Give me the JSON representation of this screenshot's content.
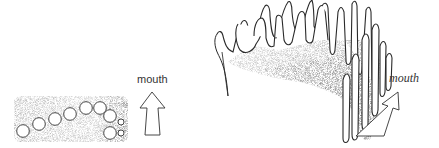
{
  "figure": {
    "left_panel": {
      "label": "mouth",
      "description": "top view of tooth row with circular tooth bases",
      "tooth_bases_large": [
        {
          "cx": 23,
          "cy": 131,
          "r": 6
        },
        {
          "cx": 39,
          "cy": 124,
          "r": 6
        },
        {
          "cx": 55,
          "cy": 119,
          "r": 6
        },
        {
          "cx": 70,
          "cy": 114,
          "r": 6
        },
        {
          "cx": 86,
          "cy": 108,
          "r": 6
        },
        {
          "cx": 100,
          "cy": 108,
          "r": 6
        },
        {
          "cx": 110,
          "cy": 116,
          "r": 6
        },
        {
          "cx": 110,
          "cy": 133,
          "r": 6
        }
      ],
      "tooth_bases_small": [
        {
          "cx": 121,
          "cy": 122,
          "r": 3
        },
        {
          "cx": 121,
          "cy": 133,
          "r": 3
        }
      ]
    },
    "right_panel": {
      "label": "mouth",
      "description": "perspective view of comb-like tooth plate"
    },
    "colors": {
      "ink": "#2a2a2a",
      "stipple": "#555555",
      "background": "#ffffff"
    }
  }
}
